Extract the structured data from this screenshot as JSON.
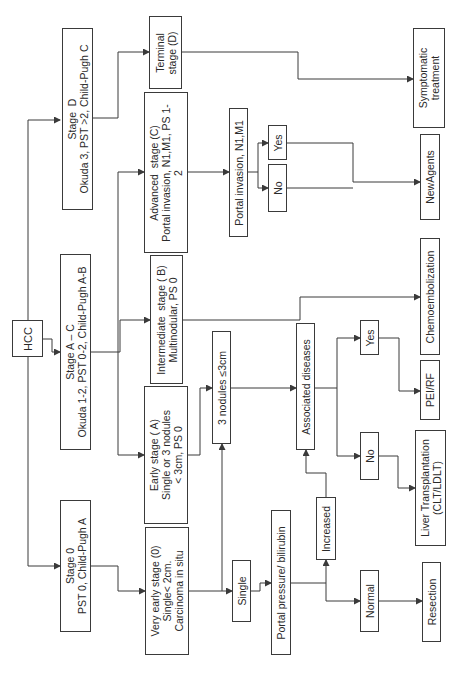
{
  "diagram": {
    "orientation": "rotated 90° counter-clockwise",
    "nodes": {
      "hcc": "HCC",
      "stage_d": "Stage  D\nOkuda 3, PST >2, Child-Pugh C",
      "stage_ac": "Stage A – C\nOkuda 1-2, PST 0-2, Child-Pugh A-B",
      "stage_0": "Stage 0\nPST 0, Child-Pugh A",
      "terminal": "Terminal\nstage (D)",
      "advanced": "Advanced  stage (C)\nPortal invasion, N1,M1, PS 1-\n2",
      "intermediate": "Intermediate  stage ( B)\nMultinodular, PS 0",
      "early": "Early stage ( A)\nSingle or 3 nodules\n< 3cm, PS 0",
      "very_early": "Very early stage (0)\nSingle< 2cm.\nCarcinoma in situ",
      "three_nodules": "3 nodules ≤3cm",
      "single": "Single",
      "portal_pressure": "Portal pressure/ bilirubin",
      "portal_invasion": "Portal invasion, N1,M1",
      "yes_upper": "Yes",
      "no_upper": "No",
      "associated": "Associated diseases",
      "increased": "Increased",
      "yes_mid": "Yes",
      "no_lower": "No",
      "normal": "Normal",
      "symptomatic": "Symptomatic\ntreatment",
      "newagents": "NewAgents",
      "chemo": "Chemoembolization",
      "pei_rf": "PEI/RF",
      "liver_tx": "Liver Transplantation\n(CLT/LDLT)",
      "resection": "Resection"
    },
    "colors": {
      "line": "#3a3a3a",
      "text": "#2a2a2a",
      "background": "#ffffff"
    }
  }
}
